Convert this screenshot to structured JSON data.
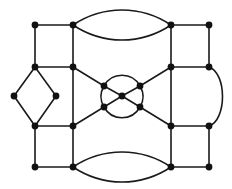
{
  "diagram": {
    "type": "graph",
    "title": "",
    "colors": {
      "edge": "#1a1a1a",
      "node": "#111111",
      "background": "#ffffff"
    },
    "nodes": [
      {
        "id": "tl1"
      },
      {
        "id": "tl2"
      },
      {
        "id": "tl3"
      },
      {
        "id": "tl4"
      },
      {
        "id": "tr1"
      },
      {
        "id": "tr2"
      },
      {
        "id": "tr3"
      },
      {
        "id": "tr4"
      },
      {
        "id": "bl1"
      },
      {
        "id": "bl2"
      },
      {
        "id": "bl3"
      },
      {
        "id": "bl4"
      },
      {
        "id": "br1"
      },
      {
        "id": "br2"
      },
      {
        "id": "br3"
      },
      {
        "id": "br4"
      },
      {
        "id": "dL"
      },
      {
        "id": "dR"
      },
      {
        "id": "c1"
      },
      {
        "id": "c2"
      },
      {
        "id": "c3"
      },
      {
        "id": "c4"
      },
      {
        "id": "c0"
      }
    ],
    "edges": [
      {
        "from": "tl1",
        "to": "tl2",
        "kind": "straight"
      },
      {
        "from": "tl1",
        "to": "tl3",
        "kind": "straight"
      },
      {
        "from": "tl2",
        "to": "tl4",
        "kind": "straight"
      },
      {
        "from": "tl3",
        "to": "tl4",
        "kind": "straight"
      },
      {
        "from": "tr1",
        "to": "tr2",
        "kind": "straight"
      },
      {
        "from": "tr1",
        "to": "tr3",
        "kind": "straight"
      },
      {
        "from": "tr2",
        "to": "tr4",
        "kind": "straight"
      },
      {
        "from": "tr3",
        "to": "tr4",
        "kind": "straight"
      },
      {
        "from": "bl1",
        "to": "bl2",
        "kind": "straight"
      },
      {
        "from": "bl1",
        "to": "bl3",
        "kind": "straight"
      },
      {
        "from": "bl2",
        "to": "bl4",
        "kind": "straight"
      },
      {
        "from": "bl3",
        "to": "bl4",
        "kind": "straight"
      },
      {
        "from": "br1",
        "to": "br2",
        "kind": "straight"
      },
      {
        "from": "br1",
        "to": "br3",
        "kind": "straight"
      },
      {
        "from": "br2",
        "to": "br4",
        "kind": "straight"
      },
      {
        "from": "br3",
        "to": "br4",
        "kind": "straight"
      },
      {
        "from": "tl4",
        "to": "bl2",
        "kind": "straight"
      },
      {
        "from": "tr3",
        "to": "br1",
        "kind": "straight"
      },
      {
        "from": "tl3",
        "to": "dL",
        "kind": "straight"
      },
      {
        "from": "tl3",
        "to": "dR",
        "kind": "straight"
      },
      {
        "from": "bl1",
        "to": "dL",
        "kind": "straight"
      },
      {
        "from": "bl1",
        "to": "dR",
        "kind": "straight"
      },
      {
        "from": "tl2",
        "to": "tr1",
        "kind": "curve-up"
      },
      {
        "from": "tl2",
        "to": "tr1",
        "kind": "curve-down"
      },
      {
        "from": "bl4",
        "to": "br3",
        "kind": "curve-up"
      },
      {
        "from": "bl4",
        "to": "br3",
        "kind": "curve-down"
      },
      {
        "from": "tr4",
        "to": "br2",
        "kind": "curve-right"
      },
      {
        "from": "tl4",
        "to": "c1",
        "kind": "straight"
      },
      {
        "from": "tr3",
        "to": "c2",
        "kind": "straight"
      },
      {
        "from": "bl2",
        "to": "c3",
        "kind": "straight"
      },
      {
        "from": "br1",
        "to": "c4",
        "kind": "straight"
      },
      {
        "from": "c1",
        "to": "c0",
        "kind": "straight"
      },
      {
        "from": "c2",
        "to": "c0",
        "kind": "straight"
      },
      {
        "from": "c3",
        "to": "c0",
        "kind": "straight"
      },
      {
        "from": "c4",
        "to": "c0",
        "kind": "straight"
      },
      {
        "from": "c1",
        "to": "c2",
        "kind": "circle-arc"
      },
      {
        "from": "c2",
        "to": "c4",
        "kind": "circle-arc"
      },
      {
        "from": "c4",
        "to": "c3",
        "kind": "circle-arc"
      },
      {
        "from": "c3",
        "to": "c1",
        "kind": "circle-arc"
      }
    ]
  }
}
